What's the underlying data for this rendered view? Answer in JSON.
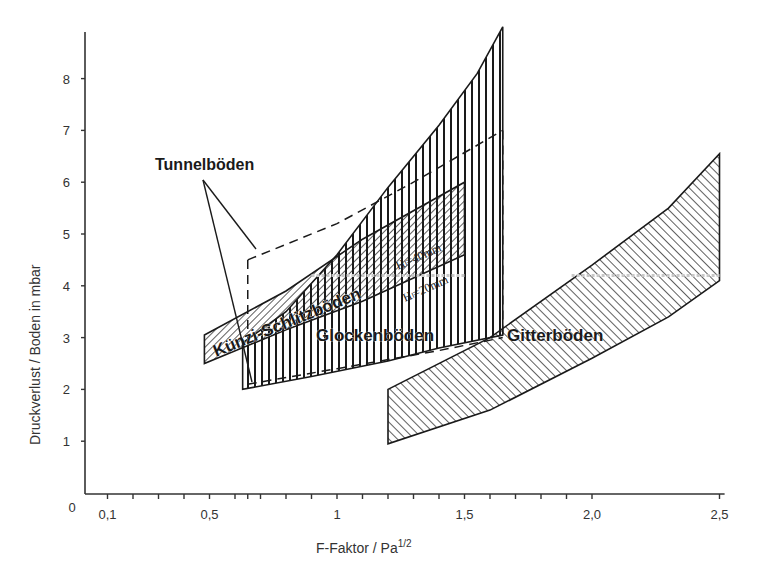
{
  "chart_data": {
    "type": "area",
    "title": "",
    "xlabel": "F-Faktor / Pa",
    "xlabel_sup": "1/2",
    "ylabel": "Druckverlust / Boden in mbar",
    "xlim": [
      0,
      2.52
    ],
    "ylim": [
      0,
      8.9
    ],
    "grid": false,
    "origin_label": "0",
    "x_ticks": [
      {
        "value": 0.1,
        "label": "0,1"
      },
      {
        "value": 0.5,
        "label": "0,5"
      },
      {
        "value": 1.0,
        "label": "1"
      },
      {
        "value": 1.5,
        "label": "1,5"
      },
      {
        "value": 2.0,
        "label": "2,0"
      },
      {
        "value": 2.5,
        "label": "2,5"
      }
    ],
    "x_minor_ticks": [
      0.2,
      0.3,
      0.4,
      0.6,
      0.65,
      0.7,
      0.8,
      0.9,
      1.1,
      1.2,
      1.3,
      1.4,
      1.6,
      1.7,
      1.8,
      1.9
    ],
    "y_ticks": [
      {
        "value": 1,
        "label": "1"
      },
      {
        "value": 2,
        "label": "2"
      },
      {
        "value": 3,
        "label": "3"
      },
      {
        "value": 4,
        "label": "4"
      },
      {
        "value": 5,
        "label": "5"
      },
      {
        "value": 6,
        "label": "6"
      },
      {
        "value": 7,
        "label": "7"
      },
      {
        "value": 8,
        "label": "8"
      }
    ],
    "series": [
      {
        "name": "Glockenböden",
        "hatch": "vertical",
        "upper": [
          [
            0.63,
            2.9
          ],
          [
            0.8,
            3.5
          ],
          [
            1.0,
            4.6
          ],
          [
            1.2,
            5.9
          ],
          [
            1.4,
            7.1
          ],
          [
            1.55,
            8.1
          ],
          [
            1.65,
            9.0
          ]
        ],
        "lower": [
          [
            0.63,
            2.0
          ],
          [
            0.9,
            2.25
          ],
          [
            1.2,
            2.55
          ],
          [
            1.4,
            2.8
          ],
          [
            1.65,
            3.05
          ]
        ],
        "label_pos": [
          1.2,
          2.9
        ]
      },
      {
        "name": "Künzi-Schlitzböden",
        "hatch": "diagonal-right",
        "upper": [
          [
            0.48,
            3.05
          ],
          [
            0.8,
            3.9
          ],
          [
            1.1,
            4.9
          ],
          [
            1.5,
            6.0
          ]
        ],
        "lower": [
          [
            0.48,
            2.5
          ],
          [
            0.8,
            3.15
          ],
          [
            1.1,
            3.7
          ],
          [
            1.5,
            4.6
          ]
        ],
        "label_pos": [
          0.75,
          3.2
        ],
        "sublabels": [
          "Hₗ=40mm",
          "Hₗ=20mm"
        ]
      },
      {
        "name": "Gitterböden",
        "hatch": "diagonal-left",
        "upper": [
          [
            1.2,
            2.0
          ],
          [
            1.6,
            3.0
          ],
          [
            2.0,
            4.4
          ],
          [
            2.3,
            5.5
          ],
          [
            2.5,
            6.55
          ]
        ],
        "lower": [
          [
            1.2,
            0.95
          ],
          [
            1.6,
            1.6
          ],
          [
            2.0,
            2.6
          ],
          [
            2.3,
            3.4
          ],
          [
            2.5,
            4.1
          ]
        ],
        "label_pos": [
          1.9,
          2.95
        ]
      },
      {
        "name": "Tunnelböden",
        "hatch": "none",
        "style": "dashed",
        "upper": [
          [
            0.65,
            4.5
          ],
          [
            1.0,
            5.2
          ],
          [
            1.3,
            6.0
          ],
          [
            1.65,
            7.0
          ]
        ],
        "lower": [
          [
            0.65,
            2.1
          ],
          [
            1.0,
            2.4
          ],
          [
            1.4,
            2.75
          ],
          [
            1.65,
            3.0
          ]
        ],
        "label": "Tunnelböden",
        "label_pos": [
          0.55,
          6.2
        ]
      }
    ],
    "dotted_reference": {
      "y": 4.2,
      "segments": [
        [
          0.9,
          1.5
        ],
        [
          1.92,
          2.5
        ]
      ]
    }
  },
  "colors": {
    "ink": "#1a1a1a",
    "axis": "#333333",
    "background": "#ffffff",
    "dotted_ref": "#c8c8c8"
  }
}
